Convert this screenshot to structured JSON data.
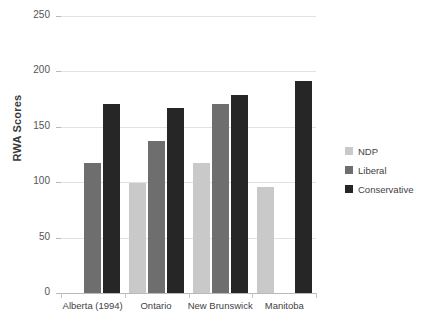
{
  "chart_data": {
    "type": "bar",
    "title": "",
    "xlabel": "",
    "ylabel": "RWA Scores",
    "ylim": [
      0,
      250
    ],
    "ytick_labels": [
      "250",
      "200",
      "150",
      "100",
      "50",
      "0"
    ],
    "ytick_values": [
      250,
      200,
      150,
      100,
      50,
      0
    ],
    "grid": true,
    "legend_position": "right",
    "categories": [
      "Alberta (1994)",
      "Ontario",
      "New Brunswick",
      "Manitoba"
    ],
    "series": [
      {
        "name": "NDP",
        "color": "#c9c9c9",
        "values": [
          null,
          99,
          117,
          96
        ]
      },
      {
        "name": "Liberal",
        "color": "#6e6e6e",
        "values": [
          117,
          137,
          171,
          null
        ]
      },
      {
        "name": "Conservative",
        "color": "#262626",
        "values": [
          171,
          167,
          179,
          191
        ]
      }
    ]
  }
}
